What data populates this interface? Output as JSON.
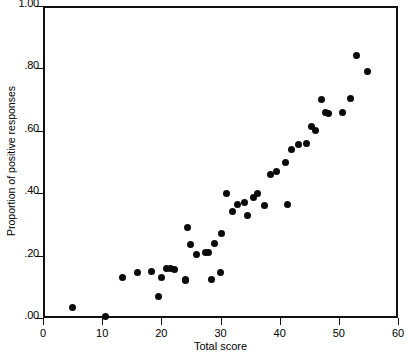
{
  "chart_data": {
    "type": "scatter",
    "title": "",
    "xlabel": "Total score",
    "ylabel": "Proportion of positive responses",
    "xlim": [
      0,
      60
    ],
    "ylim": [
      0.0,
      1.0
    ],
    "xticks": [
      0,
      10,
      20,
      30,
      40,
      50,
      60
    ],
    "xtick_labels": [
      "0",
      "10",
      "20",
      "30",
      "40",
      "50",
      "60"
    ],
    "yticks": [
      0.0,
      0.2,
      0.4,
      0.6,
      0.8,
      1.0
    ],
    "ytick_labels": [
      ".00",
      ".20",
      ".40",
      ".60",
      ".80",
      "1.00"
    ],
    "grid": false,
    "legend": null,
    "marker": {
      "shape": "circle",
      "color": "#0b0b0b",
      "size": 7
    },
    "points": [
      {
        "x": 5.0,
        "y": 0.035
      },
      {
        "x": 10.5,
        "y": 0.005
      },
      {
        "x": 13.4,
        "y": 0.13
      },
      {
        "x": 16.0,
        "y": 0.145
      },
      {
        "x": 18.4,
        "y": 0.15
      },
      {
        "x": 19.6,
        "y": 0.07
      },
      {
        "x": 20.1,
        "y": 0.13
      },
      {
        "x": 20.9,
        "y": 0.16
      },
      {
        "x": 21.5,
        "y": 0.16
      },
      {
        "x": 24.0,
        "y": 0.12
      },
      {
        "x": 24.5,
        "y": 0.29
      },
      {
        "x": 24.0,
        "y": 0.125
      },
      {
        "x": 26.0,
        "y": 0.205
      },
      {
        "x": 25.0,
        "y": 0.235
      },
      {
        "x": 27.5,
        "y": 0.21
      },
      {
        "x": 28.0,
        "y": 0.21
      },
      {
        "x": 29.0,
        "y": 0.24
      },
      {
        "x": 30.2,
        "y": 0.27
      },
      {
        "x": 31.0,
        "y": 0.4
      },
      {
        "x": 32.1,
        "y": 0.34
      },
      {
        "x": 32.9,
        "y": 0.365
      },
      {
        "x": 34.0,
        "y": 0.37
      },
      {
        "x": 34.5,
        "y": 0.33
      },
      {
        "x": 35.5,
        "y": 0.385
      },
      {
        "x": 36.3,
        "y": 0.4
      },
      {
        "x": 37.5,
        "y": 0.36
      },
      {
        "x": 38.5,
        "y": 0.46
      },
      {
        "x": 39.5,
        "y": 0.47
      },
      {
        "x": 41.4,
        "y": 0.365
      },
      {
        "x": 41.0,
        "y": 0.5
      },
      {
        "x": 42.0,
        "y": 0.54
      },
      {
        "x": 43.2,
        "y": 0.555
      },
      {
        "x": 44.5,
        "y": 0.56
      },
      {
        "x": 45.4,
        "y": 0.615
      },
      {
        "x": 46.0,
        "y": 0.6
      },
      {
        "x": 47.0,
        "y": 0.7
      },
      {
        "x": 47.8,
        "y": 0.66
      },
      {
        "x": 48.3,
        "y": 0.655
      },
      {
        "x": 50.7,
        "y": 0.66
      },
      {
        "x": 52.0,
        "y": 0.705
      },
      {
        "x": 53.0,
        "y": 0.84
      },
      {
        "x": 54.8,
        "y": 0.79
      },
      {
        "x": 22.3,
        "y": 0.155
      },
      {
        "x": 28.4,
        "y": 0.125
      },
      {
        "x": 30.0,
        "y": 0.145
      }
    ]
  },
  "axes": {
    "x_label": "Total score",
    "y_label": "Proportion of positive responses"
  }
}
